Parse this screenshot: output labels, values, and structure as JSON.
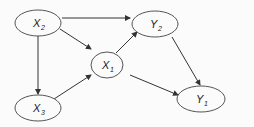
{
  "diagram": {
    "type": "directed-graph",
    "colors": {
      "background": "#fbfbfb",
      "node_fill": "#fbfbfb",
      "node_stroke": "#555555",
      "edge": "#333333",
      "text": "#222222"
    },
    "nodes": [
      {
        "id": "X2",
        "label": "X",
        "sub": "2",
        "cx": 38,
        "cy": 23,
        "rx": 23,
        "ry": 13
      },
      {
        "id": "Y2",
        "label": "Y",
        "sub": "2",
        "cx": 155,
        "cy": 24,
        "rx": 23,
        "ry": 13
      },
      {
        "id": "X1",
        "label": "X",
        "sub": "1",
        "cx": 107,
        "cy": 65,
        "rx": 16,
        "ry": 13
      },
      {
        "id": "X3",
        "label": "X",
        "sub": "3",
        "cx": 38,
        "cy": 108,
        "rx": 23,
        "ry": 13
      },
      {
        "id": "Y1",
        "label": "Y",
        "sub": "1",
        "cx": 201,
        "cy": 99,
        "rx": 24,
        "ry": 13
      }
    ],
    "edges": [
      {
        "from": "X2",
        "to": "Y2"
      },
      {
        "from": "X2",
        "to": "X1"
      },
      {
        "from": "X2",
        "to": "X3"
      },
      {
        "from": "X3",
        "to": "X1"
      },
      {
        "from": "X1",
        "to": "Y2"
      },
      {
        "from": "X1",
        "to": "Y1"
      },
      {
        "from": "Y2",
        "to": "Y1"
      }
    ]
  }
}
